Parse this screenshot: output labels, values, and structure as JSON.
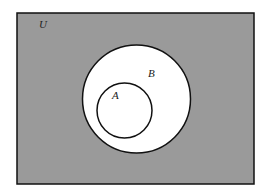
{
  "diagram": {
    "type": "venn",
    "colors": {
      "universe_fill": "#9a9a9a",
      "set_fill": "#ffffff",
      "stroke": "#111111",
      "background": "#ffffff"
    },
    "universe": {
      "label": "U",
      "x": 17,
      "y": 13,
      "width": 237,
      "height": 171
    },
    "sets": [
      {
        "id": "B",
        "label": "B",
        "cx": 136.5,
        "cy": 99,
        "r": 54,
        "label_x": 152,
        "label_y": 76
      },
      {
        "id": "A",
        "label": "A",
        "cx": 124.5,
        "cy": 110.5,
        "r": 27.5,
        "label_x": 116,
        "label_y": 99
      }
    ],
    "relation": "A ⊂ B ⊂ U",
    "shaded_region": "U \\ B"
  }
}
